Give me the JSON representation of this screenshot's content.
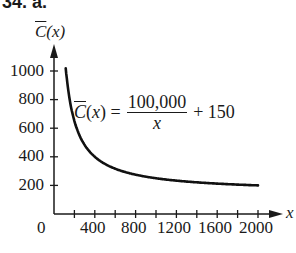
{
  "figure_label": "34. a.",
  "chart_data": {
    "type": "line",
    "title": "",
    "xlabel": "x",
    "ylabel": "C̄(x)",
    "function": "C̄(x) = 100,000/x + 150",
    "annotation": {
      "lhs": "C̄(x) =",
      "numerator": "100,000",
      "denominator": "x",
      "rhs": "+ 150"
    },
    "x_ticks": [
      0,
      400,
      800,
      1200,
      1600,
      2000
    ],
    "x_minor_ticks": [
      200,
      400,
      600,
      800,
      1000,
      1200,
      1400,
      1600,
      1800,
      2000
    ],
    "y_ticks": [
      200,
      400,
      600,
      800,
      1000
    ],
    "xlim": [
      0,
      2000
    ],
    "ylim": [
      0,
      1000
    ],
    "grid": false,
    "series": [
      {
        "name": "C̄(x)",
        "x": [
          125,
          150,
          200,
          250,
          300,
          400,
          500,
          600,
          800,
          1000,
          1200,
          1400,
          1600,
          1800,
          2000
        ],
        "y": [
          950,
          817,
          650,
          550,
          483,
          400,
          350,
          317,
          275,
          250,
          233,
          221,
          213,
          206,
          200
        ]
      }
    ]
  },
  "labels": {
    "y_axis_title": "C̄(x)",
    "x_axis_title": "x",
    "y_tick_labels": [
      "1000",
      "800",
      "600",
      "400",
      "200"
    ],
    "x_tick_labels": [
      "0",
      "400",
      "800",
      "1200",
      "1600",
      "2000"
    ]
  }
}
